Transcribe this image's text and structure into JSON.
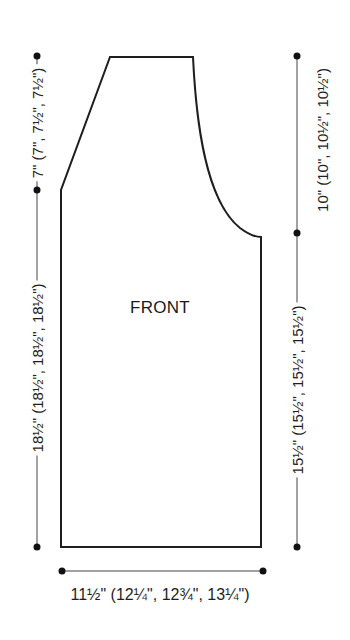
{
  "diagram": {
    "piece_label": "FRONT",
    "dimensions": {
      "left_upper": "7\" (7\", 7½\", 7½\")",
      "left_lower": "18½\" (18½\", 18½\", 18½\")",
      "right_upper": "10\" (10\", 10½\", 10½\")",
      "right_lower": "15½\" (15½\", 15½\", 15½\")",
      "bottom_width": "11½\" (12¼\", 12¾\", 13¼\")"
    },
    "colors": {
      "line": "#1e1e1e",
      "background": "#ffffff"
    }
  }
}
